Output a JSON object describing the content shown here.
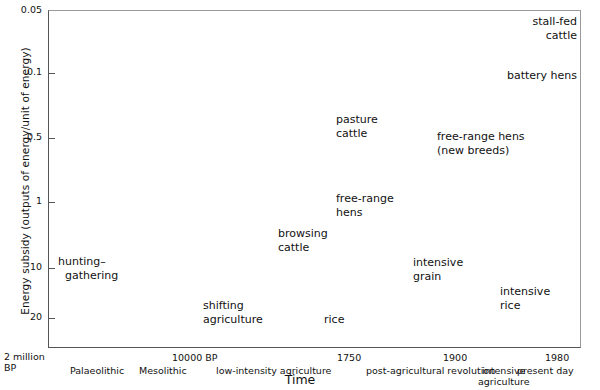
{
  "chart_data": {
    "type": "scatter",
    "title": "",
    "xlabel": "Time",
    "ylabel": "Energy subsidy (outputs of energy/unit of energy)",
    "y_scale": "inverted-log",
    "ylim": [
      0.05,
      20
    ],
    "grid": false,
    "legend": null,
    "y_ticks": [
      {
        "label": "0.05",
        "value": 0.05,
        "y": 11
      },
      {
        "label": "0.1",
        "value": 0.1,
        "y": 73
      },
      {
        "label": "0.5",
        "value": 0.5,
        "y": 138
      },
      {
        "label": "1",
        "value": 1,
        "y": 202
      },
      {
        "label": "10",
        "value": 10,
        "y": 268
      },
      {
        "label": "20",
        "value": 20,
        "y": 318
      }
    ],
    "x_axis_origin": "2 million\nBP",
    "x_year_ticks": [
      {
        "label": "10000 BP",
        "x": 172
      },
      {
        "label": "1750",
        "x": 337
      },
      {
        "label": "1900",
        "x": 443
      },
      {
        "label": "1980",
        "x": 545
      }
    ],
    "x_eras": [
      {
        "label": "Palaeolithic",
        "x": 70
      },
      {
        "label": "Mesolithic",
        "x": 139
      },
      {
        "label": "low-intensity agriculture",
        "x": 216
      },
      {
        "label": "post-agricultural revolution",
        "x": 366
      },
      {
        "label": "intensive\nagriculture",
        "x": 478
      },
      {
        "label": "present day",
        "x": 517
      }
    ],
    "points": [
      {
        "name": "hunting-gathering",
        "label": "hunting–\n  gathering",
        "x": 58,
        "y": 255,
        "align": "left",
        "y_value": 10,
        "era": "Palaeolithic"
      },
      {
        "name": "shifting-agriculture",
        "label": "shifting\nagriculture",
        "x": 203,
        "y": 299,
        "align": "left",
        "y_value": 17,
        "era": "low-intensity agriculture"
      },
      {
        "name": "browsing-cattle",
        "label": "browsing\ncattle",
        "x": 278,
        "y": 227,
        "align": "left",
        "y_value": 4,
        "era": "low-intensity agriculture"
      },
      {
        "name": "rice",
        "label": "rice",
        "x": 324,
        "y": 313,
        "align": "left",
        "y_value": 19,
        "era": "1750"
      },
      {
        "name": "free-range-hens",
        "label": "free-range\nhens",
        "x": 336,
        "y": 192,
        "align": "left",
        "y_value": 2.3,
        "era": "post-agricultural revolution"
      },
      {
        "name": "pasture-cattle",
        "label": "pasture\ncattle",
        "x": 336,
        "y": 113,
        "align": "left",
        "y_value": 0.38,
        "era": "post-agricultural revolution"
      },
      {
        "name": "intensive-grain",
        "label": "intensive\ngrain",
        "x": 413,
        "y": 256,
        "align": "left",
        "y_value": 9,
        "era": "1900"
      },
      {
        "name": "free-range-hens-new-breeds",
        "label": "free-range hens\n(new breeds)",
        "x": 437,
        "y": 130,
        "align": "left",
        "y_value": 0.45,
        "era": "1900"
      },
      {
        "name": "intensive-rice",
        "label": "intensive\nrice",
        "x": 500,
        "y": 285,
        "align": "left",
        "y_value": 14,
        "era": "intensive agriculture"
      },
      {
        "name": "battery-hens",
        "label": "battery hens",
        "x": 577,
        "y": 69,
        "align": "right",
        "y_value": 0.1,
        "era": "present day"
      },
      {
        "name": "stall-fed-cattle",
        "label": "stall-fed\ncattle",
        "x": 577,
        "y": 15,
        "align": "right",
        "y_value": 0.06,
        "era": "present day"
      }
    ]
  }
}
